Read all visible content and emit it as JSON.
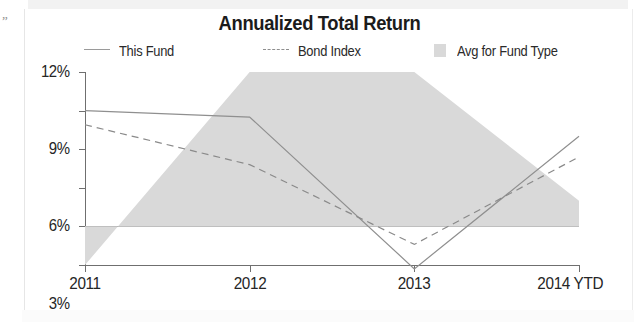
{
  "chart_data": {
    "type": "area",
    "title": "Annualized Total Return",
    "xlabel": "",
    "ylabel": "",
    "categories": [
      "2011",
      "2012",
      "2013",
      "2014 YTD"
    ],
    "ylim": [
      -3,
      12
    ],
    "yticks": [
      "-3%",
      "0%",
      "3%",
      "6%",
      "9%",
      "12%"
    ],
    "ytick_values": [
      -3,
      0,
      3,
      6,
      9,
      12
    ],
    "grid": false,
    "legend_position": "top",
    "series": [
      {
        "name": "This Fund",
        "style": "solid-line",
        "color": "#8f8f8f",
        "values": [
          9.0,
          8.5,
          -3.3,
          7.0
        ]
      },
      {
        "name": "Bond Index",
        "style": "dashed-line",
        "color": "#8a8a8a",
        "values": [
          7.9,
          4.8,
          -1.4,
          5.4
        ]
      },
      {
        "name": "Avg for Fund Type",
        "style": "filled-area",
        "color": "#d9d9d9",
        "values": [
          -3.0,
          12.0,
          12.0,
          2.0
        ]
      }
    ]
  },
  "legend": {
    "items": [
      {
        "label": "This Fund",
        "swatch": "solid-line-swatch"
      },
      {
        "label": "Bond Index",
        "swatch": "dashed-line-swatch"
      },
      {
        "label": "Avg for Fund Type",
        "swatch": "area-fill-swatch"
      }
    ]
  },
  "scan": {
    "corner_mark": "„"
  }
}
